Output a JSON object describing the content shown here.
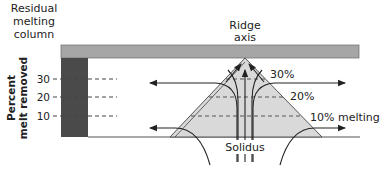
{
  "diagram": {
    "column_title": [
      "Residual",
      "melting",
      "column"
    ],
    "ridge_title": [
      "Ridge",
      "axis"
    ],
    "y_axis_label": [
      "Percent",
      "melt removed"
    ],
    "y_ticks": [
      "30",
      "20",
      "10"
    ],
    "melt_levels": [
      "30%",
      "20%",
      "10% melting"
    ],
    "solidus_label": "Solidus",
    "colors": {
      "crust_bar": "#a6a6a6",
      "residual_column": "#4a4a4a",
      "melt_triangle": "#d9d9d9",
      "lines": "#222222"
    }
  }
}
